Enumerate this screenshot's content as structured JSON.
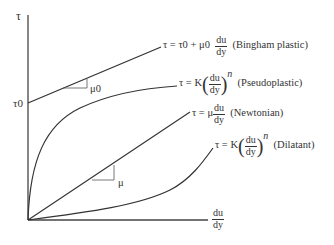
{
  "axes": {
    "y_label": "τ",
    "y_intercept_label": "τ0",
    "x_label_num": "du",
    "x_label_den": "dy"
  },
  "curves": [
    {
      "id": "bingham",
      "eq_prefix": "τ = τ0 + μ0",
      "frac_num": "du",
      "frac_den": "dy",
      "name": "(Bingham plastic)",
      "slope_label": "μ0"
    },
    {
      "id": "pseudoplastic",
      "eq_prefix": "τ = K",
      "frac_num": "du",
      "frac_den": "dy",
      "exponent": "n",
      "name": "(Pseudoplastic)"
    },
    {
      "id": "newtonian",
      "eq_prefix": "τ = μ",
      "frac_num": "du",
      "frac_den": "dy",
      "name": "(Newtonian)",
      "slope_label": "μ"
    },
    {
      "id": "dilatant",
      "eq_prefix": "τ = K",
      "frac_num": "du",
      "frac_den": "dy",
      "exponent": "n",
      "name": "(Dilatant)"
    }
  ],
  "colors": {
    "line": "#333333",
    "background": "#ffffff"
  }
}
